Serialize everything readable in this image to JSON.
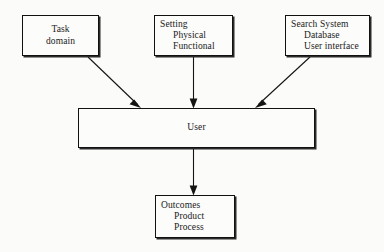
{
  "diagram": {
    "background_color": "#fbfbf9",
    "line_color": "#141414",
    "nodes": {
      "task_domain": {
        "name": "Task domain",
        "lines": [
          "Task",
          "domain"
        ],
        "line1": "Task",
        "line2": "domain"
      },
      "setting": {
        "name": "Setting",
        "lines": [
          "Setting",
          "Physical",
          "Functional"
        ],
        "line1": "Setting",
        "line2": "Physical",
        "line3": "Functional"
      },
      "search_system": {
        "name": "Search System",
        "lines": [
          "Search System",
          "Database",
          "User interface"
        ],
        "line1": "Search System",
        "line2": "Database",
        "line3": "User interface"
      },
      "user": {
        "name": "User",
        "lines": [
          "User"
        ],
        "line1": "User"
      },
      "outcomes": {
        "name": "Outcomes",
        "lines": [
          "Outcomes",
          "Product",
          "Process"
        ],
        "line1": "Outcomes",
        "line2": "Product",
        "line3": "Process"
      }
    },
    "edges": [
      {
        "id": "task-to-user",
        "from": "task_domain",
        "to": "user",
        "style": "diagonal-arrow"
      },
      {
        "id": "setting-to-user",
        "from": "setting",
        "to": "user",
        "style": "vertical-arrow"
      },
      {
        "id": "search-to-user",
        "from": "search_system",
        "to": "user",
        "style": "diagonal-arrow"
      },
      {
        "id": "user-to-outcomes",
        "from": "user",
        "to": "outcomes",
        "style": "vertical-arrow"
      }
    ]
  }
}
